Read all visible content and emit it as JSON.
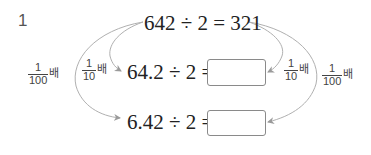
{
  "problem": {
    "number": "1",
    "top_equation": "642 ÷ 2 = 321",
    "middle_equation": "64.2 ÷ 2 =",
    "bottom_equation": "6.42 ÷ 2 =",
    "middle_answer": "",
    "bottom_answer": ""
  },
  "labels": {
    "left_outer": {
      "numerator": "1",
      "denominator": "100",
      "unit": "배"
    },
    "left_inner": {
      "numerator": "1",
      "denominator": "10",
      "unit": "배"
    },
    "right_inner": {
      "numerator": "1",
      "denominator": "10",
      "unit": "배"
    },
    "right_outer": {
      "numerator": "1",
      "denominator": "100",
      "unit": "배"
    }
  },
  "colors": {
    "arrow": "#a8a8a8",
    "text": "#222222",
    "box_border": "#8a8a8a"
  }
}
